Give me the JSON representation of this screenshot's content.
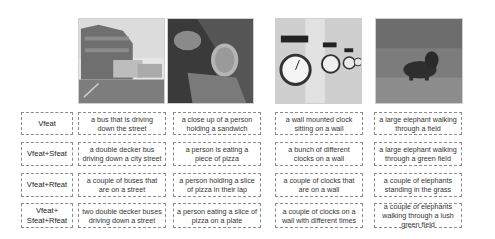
{
  "images": [
    {
      "subject": "street-with-buses-photo"
    },
    {
      "subject": "person-holding-pizza-photo"
    },
    {
      "subject": "wall-clocks-photo"
    },
    {
      "subject": "elephant-in-field-photo"
    }
  ],
  "rows": [
    {
      "label": "Vfeat",
      "captions": [
        "a bus that is driving down the street",
        "a close up of a person holding a sandwich",
        "a wall mounted clock sitting on a wall",
        "a large elephant walking through a field"
      ]
    },
    {
      "label": "Vfeat+Sfeat",
      "captions": [
        "a double decker bus driving down a city street",
        "a person is eating a piece of pizza",
        "a bunch of different clocks on a wall",
        "a large elephant walking through a green field"
      ]
    },
    {
      "label": "Vfeat+Rfeat",
      "captions": [
        "a couple of buses that are on a street",
        "a person holding a slice of pizza in their lap",
        "a couple of clocks that are on a wall",
        "a couple of elephants standing in the grass"
      ]
    },
    {
      "label": "Vfeat+ Sfeat+Rfeat",
      "captions": [
        "two double decker buses driving down a street",
        "a person eating a slice of pizza on a plate",
        "a couple of clocks on a wall with different times",
        "a couple of elephants walking through a lush green field"
      ]
    }
  ]
}
